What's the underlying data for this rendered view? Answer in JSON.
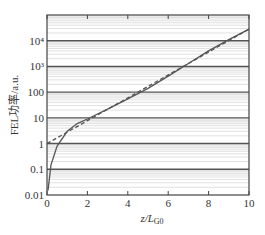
{
  "chart_data": {
    "type": "line",
    "title": "",
    "xlabel": "z/L_G0",
    "xlabel_main": "z/",
    "xlabel_italic": "L",
    "xlabel_sub": "G0",
    "ylabel": "FEL功率/a.u.",
    "xlim": [
      0,
      10
    ],
    "ylim": [
      0.01,
      100000
    ],
    "yscale": "log",
    "grid": true,
    "x_ticks": [
      "0",
      "2",
      "4",
      "6",
      "8",
      "10"
    ],
    "y_ticks": [
      "0.01",
      "0.1",
      "1",
      "10",
      "100",
      "10³",
      "10⁴"
    ],
    "series": [
      {
        "name": "FEL power (simulation)",
        "style": "solid",
        "x": [
          0.05,
          0.2,
          0.5,
          1,
          1.5,
          2,
          3,
          4,
          5,
          6,
          7,
          8,
          9,
          10
        ],
        "y": [
          0.015,
          0.15,
          0.8,
          3,
          6,
          9,
          22,
          55,
          140,
          420,
          1300,
          4000,
          11000,
          28000
        ]
      },
      {
        "name": "Exponential growth fit",
        "style": "dashed",
        "x": [
          0,
          2,
          4,
          6,
          8,
          10
        ],
        "y": [
          1,
          7,
          45,
          300,
          3000,
          28000
        ]
      }
    ],
    "legend": null
  }
}
